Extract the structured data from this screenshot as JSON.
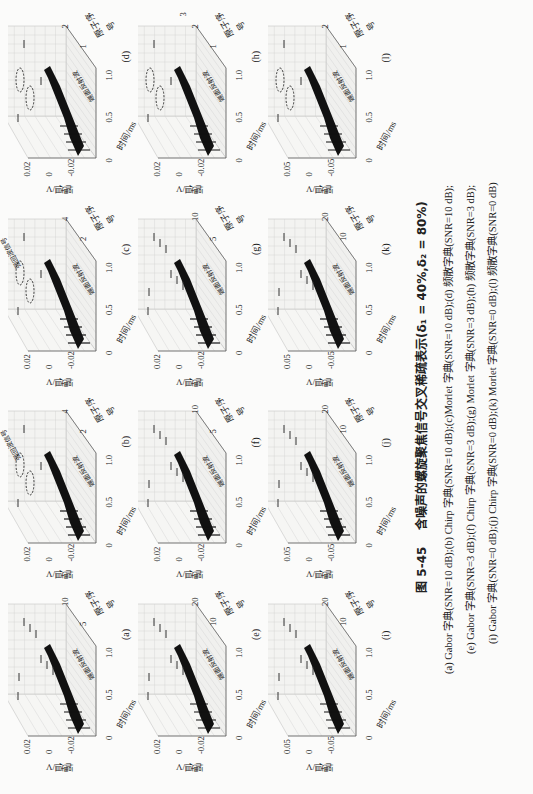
{
  "figure": {
    "number": "图 5-45",
    "title": "含噪声的螺旋聚焦信号交叉稀疏表示(δ₁ = 40%,δ₂ = 80%)"
  },
  "axes_common": {
    "ylabel": "幅值/V",
    "xlabel": "时间/ms",
    "zlabel": "原子序号",
    "x_ticks": [
      "0",
      "0.5",
      "1.0"
    ],
    "reflection_label": "端面反射波",
    "strong_signal_label": "强回波信号"
  },
  "panels": [
    {
      "label": "(a)",
      "y_ticks": [
        "0.02",
        "0",
        "-0.02"
      ],
      "z_ticks": [
        "5",
        "10"
      ]
    },
    {
      "label": "(b)",
      "y_ticks": [
        "0.02",
        "0",
        "-0.02"
      ],
      "z_ticks": [
        "2",
        "4"
      ]
    },
    {
      "label": "(c)",
      "y_ticks": [
        "0.02",
        "0",
        "-0.02"
      ],
      "z_ticks": [
        "2",
        "4"
      ]
    },
    {
      "label": "(d)",
      "y_ticks": [
        "0.02",
        "0",
        "-0.02"
      ],
      "z_ticks": [
        "1",
        "2"
      ]
    },
    {
      "label": "(e)",
      "y_ticks": [
        "0.02",
        "0",
        "-0.02"
      ],
      "z_ticks": [
        "10",
        "20"
      ]
    },
    {
      "label": "(f)",
      "y_ticks": [
        "0.02",
        "0",
        "-0.02"
      ],
      "z_ticks": [
        "5",
        "10"
      ]
    },
    {
      "label": "(g)",
      "y_ticks": [
        "0.02",
        "0",
        "-0.02"
      ],
      "z_ticks": [
        "5",
        "10"
      ]
    },
    {
      "label": "(h)",
      "y_ticks": [
        "0.02",
        "0",
        "-0.02"
      ],
      "z_ticks": [
        "1",
        "2",
        "3"
      ]
    },
    {
      "label": "(i)",
      "y_ticks": [
        "0.05",
        "0",
        "-0.05"
      ],
      "z_ticks": [
        "10",
        "20"
      ]
    },
    {
      "label": "(j)",
      "y_ticks": [
        "0.05",
        "0",
        "-0.05"
      ],
      "z_ticks": [
        "10",
        "20"
      ]
    },
    {
      "label": "(k)",
      "y_ticks": [
        "0.05",
        "0",
        "-0.05"
      ],
      "z_ticks": [
        "10",
        "20"
      ]
    },
    {
      "label": "(l)",
      "y_ticks": [
        "0.05",
        "0",
        "-0.05"
      ],
      "z_ticks": [
        "1",
        "2"
      ]
    }
  ],
  "caption_lines": [
    "(a) Gabor 字典(SNR=10 dB);(b) Chirp 字典(SNR=10 dB);(c)Morlet 字典(SNR=10 dB);(d) 频散字典(SNR=10 dB);",
    "(e) Gabor 字典(SNR=3 dB);(f) Chirp 字典(SNR=3 dB);(g) Morlet 字典(SNR=3 dB);(h) 频散字典(SNR=3 dB);",
    "(i) Gabor 字典(SNR=0 dB);(j) Chirp 字典(SNR=0 dB);(k) Morlet 字典(SNR=0 dB);(l) 频散字典(SNR=0 dB)"
  ],
  "chart_data": [
    {
      "type": "scatter",
      "title": "(a) Gabor 字典 (SNR=10 dB)",
      "xlabel": "时间/ms",
      "ylabel": "幅值/V",
      "zlabel": "原子序号",
      "xlim": [
        0,
        1.0
      ],
      "ylim": [
        -0.02,
        0.02
      ],
      "zlim": [
        0,
        10
      ]
    },
    {
      "type": "scatter",
      "title": "(b) Chirp 字典 (SNR=10 dB)",
      "xlabel": "时间/ms",
      "ylabel": "幅值/V",
      "zlabel": "原子序号",
      "xlim": [
        0,
        1.0
      ],
      "ylim": [
        -0.02,
        0.02
      ],
      "zlim": [
        0,
        4
      ],
      "annotations": [
        "强回波信号"
      ]
    },
    {
      "type": "scatter",
      "title": "(c) Morlet 字典 (SNR=10 dB)",
      "xlabel": "时间/ms",
      "ylabel": "幅值/V",
      "zlabel": "原子序号",
      "xlim": [
        0,
        1.0
      ],
      "ylim": [
        -0.02,
        0.02
      ],
      "zlim": [
        0,
        4
      ],
      "annotations": [
        "强回波信号"
      ]
    },
    {
      "type": "scatter",
      "title": "(d) 频散字典 (SNR=10 dB)",
      "xlabel": "时间/ms",
      "ylabel": "幅值/V",
      "zlabel": "原子序号",
      "xlim": [
        0,
        1.0
      ],
      "ylim": [
        -0.02,
        0.02
      ],
      "zlim": [
        0,
        2
      ]
    },
    {
      "type": "scatter",
      "title": "(e) Gabor 字典 (SNR=3 dB)",
      "xlabel": "时间/ms",
      "ylabel": "幅值/V",
      "zlabel": "原子序号",
      "xlim": [
        0,
        1.0
      ],
      "ylim": [
        -0.02,
        0.02
      ],
      "zlim": [
        0,
        20
      ]
    },
    {
      "type": "scatter",
      "title": "(f) Chirp 字典 (SNR=3 dB)",
      "xlabel": "时间/ms",
      "ylabel": "幅值/V",
      "zlabel": "原子序号",
      "xlim": [
        0,
        1.0
      ],
      "ylim": [
        -0.02,
        0.02
      ],
      "zlim": [
        0,
        10
      ]
    },
    {
      "type": "scatter",
      "title": "(g) Morlet 字典 (SNR=3 dB)",
      "xlabel": "时间/ms",
      "ylabel": "幅值/V",
      "zlabel": "原子序号",
      "xlim": [
        0,
        1.0
      ],
      "ylim": [
        -0.02,
        0.02
      ],
      "zlim": [
        0,
        10
      ]
    },
    {
      "type": "scatter",
      "title": "(h) 频散字典 (SNR=3 dB)",
      "xlabel": "时间/ms",
      "ylabel": "幅值/V",
      "zlabel": "原子序号",
      "xlim": [
        0,
        1.0
      ],
      "ylim": [
        -0.02,
        0.02
      ],
      "zlim": [
        0,
        3
      ]
    },
    {
      "type": "scatter",
      "title": "(i) Gabor 字典 (SNR=0 dB)",
      "xlabel": "时间/ms",
      "ylabel": "幅值/V",
      "zlabel": "原子序号",
      "xlim": [
        0,
        1.0
      ],
      "ylim": [
        -0.05,
        0.05
      ],
      "zlim": [
        0,
        20
      ]
    },
    {
      "type": "scatter",
      "title": "(j) Chirp 字典 (SNR=0 dB)",
      "xlabel": "时间/ms",
      "ylabel": "幅值/V",
      "zlabel": "原子序号",
      "xlim": [
        0,
        1.0
      ],
      "ylim": [
        -0.05,
        0.05
      ],
      "zlim": [
        0,
        20
      ]
    },
    {
      "type": "scatter",
      "title": "(k) Morlet 字典 (SNR=0 dB)",
      "xlabel": "时间/ms",
      "ylabel": "幅值/V",
      "zlabel": "原子序号",
      "xlim": [
        0,
        1.0
      ],
      "ylim": [
        -0.05,
        0.05
      ],
      "zlim": [
        0,
        20
      ]
    },
    {
      "type": "scatter",
      "title": "(l) 频散字典 (SNR=0 dB)",
      "xlabel": "时间/ms",
      "ylabel": "幅值/V",
      "zlabel": "原子序号",
      "xlim": [
        0,
        1.0
      ],
      "ylim": [
        -0.05,
        0.05
      ],
      "zlim": [
        0,
        2
      ]
    }
  ]
}
